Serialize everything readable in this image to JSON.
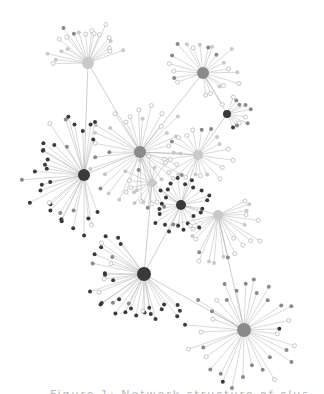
{
  "figure": {
    "type": "network-graph",
    "caption": "Figure 1: Network structure of clusters",
    "colors": {
      "dark": "#3a3a3a",
      "mid": "#8a8a8a",
      "light": "#c9c9c9",
      "hollow_stroke": "#b0b0b0",
      "edge": "#9a9a9a",
      "background": "#ffffff"
    },
    "hubs": [
      {
        "id": "h1",
        "x": 88,
        "y": 63,
        "r": 6,
        "tone": "light",
        "leaves": 20,
        "spread": 170,
        "dir": -100,
        "len": 42,
        "leafTone": "mix-light"
      },
      {
        "id": "h2",
        "x": 203,
        "y": 73,
        "r": 6,
        "tone": "mid",
        "leaves": 22,
        "spread": 300,
        "dir": -60,
        "len": 38,
        "leafTone": "mix-light"
      },
      {
        "id": "h3",
        "x": 227,
        "y": 114,
        "r": 4,
        "tone": "dark",
        "leaves": 10,
        "spread": 150,
        "dir": 0,
        "len": 26,
        "leafTone": "mix-mid"
      },
      {
        "id": "h4",
        "x": 140,
        "y": 152,
        "r": 6,
        "tone": "mid",
        "leaves": 34,
        "spread": 360,
        "dir": -90,
        "len": 52,
        "leafTone": "mix-light"
      },
      {
        "id": "h5",
        "x": 84,
        "y": 175,
        "r": 6,
        "tone": "dark",
        "leaves": 34,
        "spread": 220,
        "dir": 180,
        "len": 60,
        "leafTone": "mix-dark"
      },
      {
        "id": "h6",
        "x": 198,
        "y": 155,
        "r": 5,
        "tone": "light",
        "leaves": 20,
        "spread": 360,
        "dir": 0,
        "len": 36,
        "leafTone": "mix-light"
      },
      {
        "id": "h7",
        "x": 152,
        "y": 183,
        "r": 4,
        "tone": "light",
        "leaves": 14,
        "spread": 260,
        "dir": 180,
        "len": 28,
        "leafTone": "mix-light"
      },
      {
        "id": "h8",
        "x": 181,
        "y": 205,
        "r": 5,
        "tone": "dark",
        "leaves": 24,
        "spread": 360,
        "dir": 0,
        "len": 30,
        "leafTone": "dark"
      },
      {
        "id": "h9",
        "x": 218,
        "y": 215,
        "r": 5,
        "tone": "light",
        "leaves": 22,
        "spread": 200,
        "dir": 70,
        "len": 48,
        "leafTone": "mix-light"
      },
      {
        "id": "h10",
        "x": 144,
        "y": 274,
        "r": 7,
        "tone": "dark",
        "leaves": 34,
        "spread": 200,
        "dir": 140,
        "len": 56,
        "leafTone": "mix-dark"
      },
      {
        "id": "h11",
        "x": 244,
        "y": 330,
        "r": 7,
        "tone": "mid",
        "leaves": 34,
        "spread": 360,
        "dir": 0,
        "len": 58,
        "leafTone": "mix-mid"
      }
    ],
    "hub_links": [
      [
        "h1",
        "h4"
      ],
      [
        "h1",
        "h5"
      ],
      [
        "h2",
        "h4"
      ],
      [
        "h2",
        "h3"
      ],
      [
        "h4",
        "h5"
      ],
      [
        "h4",
        "h7"
      ],
      [
        "h4",
        "h6"
      ],
      [
        "h6",
        "h8"
      ],
      [
        "h7",
        "h8"
      ],
      [
        "h8",
        "h9"
      ],
      [
        "h8",
        "h10"
      ],
      [
        "h7",
        "h10"
      ],
      [
        "h10",
        "h11"
      ],
      [
        "h9",
        "h11"
      ],
      [
        "h3",
        "h6"
      ]
    ]
  }
}
